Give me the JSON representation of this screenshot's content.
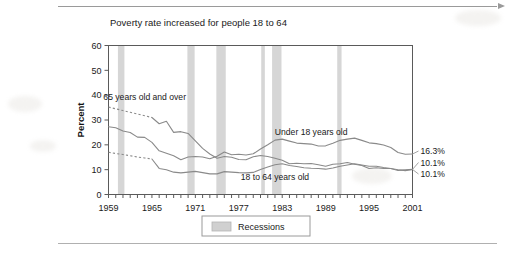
{
  "page": {
    "rule_top": "horizontal-rule",
    "rule_bottom": "horizontal-rule"
  },
  "chart_data": {
    "type": "line",
    "title": "Poverty rate increased for people 18 to 64",
    "xlabel": "",
    "ylabel": "Percent",
    "xlim": [
      1959,
      2001
    ],
    "ylim": [
      0,
      60
    ],
    "ytick_step": 10,
    "yticks": [
      "0",
      "10",
      "20",
      "30",
      "40",
      "50",
      "60"
    ],
    "xticks": [
      "1959",
      "1965",
      "1971",
      "1977",
      "1983",
      "1989",
      "1995",
      "2001"
    ],
    "xtick_step_minor": 1,
    "grid": false,
    "legend_position": "below-axis-center",
    "legend": [
      {
        "label": "Recessions",
        "color": "#d0d0d0"
      }
    ],
    "series": [
      {
        "name": "65 years old and over",
        "label": "65 years old and over",
        "label_x": 1964,
        "label_y": 38,
        "end_value": "10.1%",
        "end_value_rank": 3,
        "color": "#8a8a8a",
        "dashed_through": 1965,
        "x": [
          1959,
          1960,
          1961,
          1962,
          1963,
          1964,
          1965,
          1966,
          1967,
          1968,
          1969,
          1970,
          1971,
          1972,
          1973,
          1974,
          1975,
          1976,
          1977,
          1978,
          1979,
          1980,
          1981,
          1982,
          1983,
          1984,
          1985,
          1986,
          1987,
          1988,
          1989,
          1990,
          1991,
          1992,
          1993,
          1994,
          1995,
          1996,
          1997,
          1998,
          1999,
          2000,
          2001
        ],
        "y": [
          35.2,
          34.5,
          33.8,
          33.1,
          32.4,
          31.7,
          31.0,
          28.5,
          29.5,
          25.0,
          25.3,
          24.6,
          21.6,
          18.6,
          16.3,
          14.6,
          15.3,
          15.0,
          14.1,
          14.0,
          15.2,
          15.7,
          15.3,
          14.6,
          13.8,
          12.4,
          12.6,
          12.4,
          12.5,
          12.0,
          11.4,
          12.2,
          12.4,
          12.9,
          12.2,
          11.7,
          10.5,
          10.8,
          10.5,
          10.5,
          9.7,
          9.9,
          10.1
        ]
      },
      {
        "name": "Under 18 years old",
        "label": "Under 18 years old",
        "label_x": 1987,
        "label_y": 24,
        "end_value": "16.3%",
        "end_value_rank": 1,
        "color": "#8a8a8a",
        "dashed_through": null,
        "x": [
          1959,
          1960,
          1961,
          1962,
          1963,
          1964,
          1965,
          1966,
          1967,
          1968,
          1969,
          1970,
          1971,
          1972,
          1973,
          1974,
          1975,
          1976,
          1977,
          1978,
          1979,
          1980,
          1981,
          1982,
          1983,
          1984,
          1985,
          1986,
          1987,
          1988,
          1989,
          1990,
          1991,
          1992,
          1993,
          1994,
          1995,
          1996,
          1997,
          1998,
          1999,
          2000,
          2001
        ],
        "y": [
          27.3,
          26.9,
          25.6,
          25.0,
          23.1,
          23.0,
          21.0,
          17.6,
          16.6,
          15.6,
          14.0,
          15.1,
          15.3,
          15.1,
          14.4,
          15.4,
          17.1,
          16.0,
          16.2,
          15.9,
          16.4,
          18.3,
          20.0,
          21.9,
          22.3,
          21.5,
          20.7,
          20.5,
          20.3,
          19.5,
          19.6,
          20.6,
          21.8,
          22.3,
          22.7,
          21.8,
          20.8,
          20.5,
          19.9,
          18.9,
          16.9,
          16.2,
          16.3
        ]
      },
      {
        "name": "18 to 64 years old",
        "label": "18 to 64 years old",
        "label_x": 1982,
        "label_y": 6,
        "end_value": "10.1%",
        "end_value_rank": 2,
        "color": "#8a8a8a",
        "dashed_through": 1965,
        "x": [
          1959,
          1960,
          1961,
          1962,
          1963,
          1964,
          1965,
          1966,
          1967,
          1968,
          1969,
          1970,
          1971,
          1972,
          1973,
          1974,
          1975,
          1976,
          1977,
          1978,
          1979,
          1980,
          1981,
          1982,
          1983,
          1984,
          1985,
          1986,
          1987,
          1988,
          1989,
          1990,
          1991,
          1992,
          1993,
          1994,
          1995,
          1996,
          1997,
          1998,
          1999,
          2000,
          2001
        ],
        "y": [
          17.0,
          16.5,
          16.1,
          15.6,
          15.1,
          14.7,
          14.3,
          10.5,
          10.0,
          9.0,
          8.7,
          9.0,
          9.3,
          8.8,
          8.3,
          8.3,
          9.2,
          9.0,
          8.8,
          8.7,
          8.9,
          10.1,
          11.1,
          12.0,
          12.4,
          11.7,
          11.3,
          10.8,
          10.6,
          10.5,
          10.2,
          10.7,
          11.4,
          11.9,
          12.4,
          11.9,
          11.4,
          11.4,
          10.9,
          10.5,
          10.0,
          9.6,
          10.1
        ]
      }
    ],
    "recessions": [
      {
        "start": 1960.3,
        "end": 1961.2
      },
      {
        "start": 1969.9,
        "end": 1970.9
      },
      {
        "start": 1973.9,
        "end": 1975.2
      },
      {
        "start": 1980.1,
        "end": 1980.6
      },
      {
        "start": 1981.6,
        "end": 1982.9
      },
      {
        "start": 1990.6,
        "end": 1991.2
      }
    ],
    "recession_color": "#d6d6d6",
    "axis_color": "#5a5a5a",
    "line_color": "#8a8a8a"
  }
}
